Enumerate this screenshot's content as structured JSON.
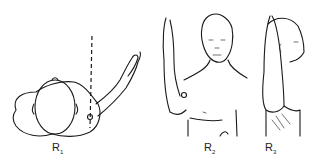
{
  "figure": {
    "panels": [
      {
        "id": "R1",
        "label": "R",
        "subscript": "1",
        "view": "top-down view, arm raised forward with vertical reference line"
      },
      {
        "id": "R2",
        "label": "R",
        "subscript": "2",
        "view": "front view, right arm raised overhead"
      },
      {
        "id": "R3",
        "label": "R",
        "subscript": "3",
        "view": "side view, arm raised overhead beside head"
      }
    ],
    "colors": {
      "line": "#1a1a1a",
      "background": "#ffffff"
    }
  }
}
